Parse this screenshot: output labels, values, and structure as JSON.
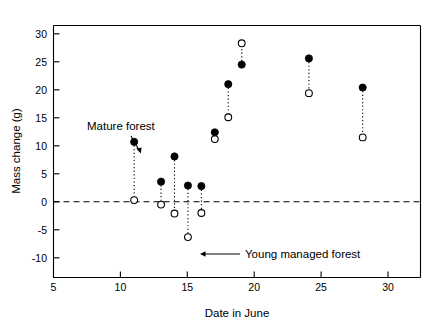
{
  "chart_data": {
    "type": "scatter",
    "title": "",
    "xlabel": "Date in June",
    "ylabel": "Mass change (g)",
    "xlim": [
      5,
      32.3
    ],
    "ylim": [
      -10,
      32.5
    ],
    "xticks": [
      5,
      10,
      15,
      20,
      25,
      30
    ],
    "yticks": [
      30,
      25,
      20,
      15,
      10,
      5,
      0,
      -5,
      -10
    ],
    "xticklabels": [
      "5",
      "10",
      "15",
      "20",
      "25",
      "30"
    ],
    "yticklabels": [
      "30",
      "25",
      "20",
      "15",
      "10",
      "5",
      "0",
      "-5",
      "-10"
    ],
    "grid": false,
    "legend": "none",
    "reference_lines": [
      {
        "axis": "y",
        "value": 0,
        "style": "dashed"
      }
    ],
    "series": [
      {
        "name": "Mature forest",
        "marker": "filled-circle",
        "x": [
          11,
          13,
          14,
          15,
          16,
          17,
          18,
          19,
          24,
          28
        ],
        "values": [
          10.7,
          3.6,
          8.1,
          2.9,
          2.8,
          12.4,
          21.0,
          24.5,
          25.6,
          20.4
        ]
      },
      {
        "name": "Young managed forest",
        "marker": "open-circle",
        "x": [
          11,
          13,
          14,
          15,
          16,
          17,
          18,
          19,
          24,
          28
        ],
        "values": [
          0.3,
          -0.5,
          -2.1,
          -6.3,
          -2.0,
          11.2,
          15.1,
          28.3,
          19.4,
          11.5
        ]
      }
    ],
    "pairs_connected": true,
    "connector_style": "dotted",
    "annotations": [
      {
        "name": "mature-forest",
        "text": "Mature forest",
        "points_to_x": 11,
        "points_to_y": 10.7
      },
      {
        "name": "young-managed-forest",
        "text": "Young managed forest",
        "points_to_x": 15,
        "points_to_y": -6.3
      }
    ]
  },
  "axes": {
    "x_title": "Date in June",
    "y_title": "Mass change (g)"
  },
  "annotations": {
    "mature_label": "Mature forest",
    "young_label": "Young managed forest"
  },
  "colors": {
    "foreground": "#000000",
    "background": "#ffffff",
    "filled_marker": "#000000",
    "open_marker": "#ffffff"
  }
}
